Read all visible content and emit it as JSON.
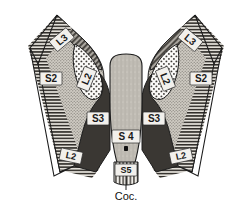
{
  "figure": {
    "background_color": "#ffffff",
    "outline_color": "#1c1c1c",
    "width": 252,
    "height": 207
  },
  "palette": {
    "outer_hatch_band": "#d8d4cc",
    "light_stipple_field": "#c9c5bd",
    "diagonal_hatch_band": "#8e8a84",
    "white_dotted_field": "#f6f5f2",
    "dark_solid_field": "#3a3733",
    "central_stipple_field": "#bfbbb2",
    "coccyx_field": "#e8e6e1",
    "label_box_fill": "#f2f0ec",
    "label_text": "#1a1a1a",
    "dot_marker": "#111111"
  },
  "regions": [
    {
      "id": "left-outer-band",
      "name": "left-outer-hatched-band",
      "texture": "horizontal-hatch",
      "label": "L2"
    },
    {
      "id": "right-outer-band",
      "name": "right-outer-hatched-band",
      "texture": "horizontal-hatch",
      "label": "L2"
    },
    {
      "id": "left-s2-field",
      "name": "left-s2-region",
      "texture": "fine-stipple",
      "label": "S2"
    },
    {
      "id": "right-s2-field",
      "name": "right-s2-region",
      "texture": "fine-stipple",
      "label": "S2"
    },
    {
      "id": "left-l3-band",
      "name": "left-l3-region",
      "texture": "diagonal-hatch",
      "label": "L3"
    },
    {
      "id": "right-l3-band",
      "name": "right-l3-region",
      "texture": "diagonal-hatch",
      "label": "L3"
    },
    {
      "id": "left-l2-oval",
      "name": "left-l2-region",
      "texture": "coarse-dots",
      "label": "L2"
    },
    {
      "id": "right-l2-oval",
      "name": "right-l2-region",
      "texture": "coarse-dots",
      "label": "L2"
    },
    {
      "id": "left-s3-field",
      "name": "left-s3-region",
      "texture": "solid-dark",
      "label": "S3"
    },
    {
      "id": "right-s3-field",
      "name": "right-s3-region",
      "texture": "solid-dark",
      "label": "S3"
    },
    {
      "id": "central-s4-field",
      "name": "central-s4-region",
      "texture": "vertical-stipple",
      "label": "S 4"
    },
    {
      "id": "coccyx-s5-field",
      "name": "coccyx-s5-region",
      "texture": "vertical-stripe",
      "label": "S5"
    }
  ],
  "labels": {
    "l3_left": "L3",
    "l3_right": "L3",
    "s2_left": "S2",
    "s2_right": "S2",
    "l2_oval_left": "L2",
    "l2_oval_right": "L2",
    "s3_left": "S3",
    "s3_right": "S3",
    "s4_center": "S 4",
    "l2_band_left": "L2",
    "l2_band_right": "L2",
    "s5_coccyx": "S5",
    "coccyx_caption": "Coc."
  },
  "annotations": [
    {
      "name": "midline-dot-marker",
      "description": "small solid black dot on the midline below the S 4 label"
    },
    {
      "name": "coccyx-leader-line",
      "description": "vertical leader line from the S5 box down to the Coc. caption"
    }
  ]
}
